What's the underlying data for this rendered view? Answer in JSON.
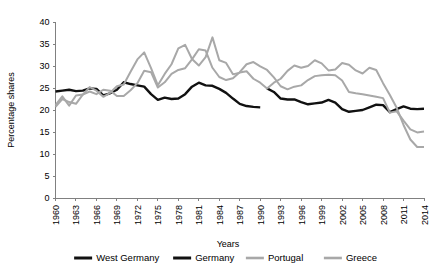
{
  "chart_data": {
    "type": "line",
    "title": "",
    "xlabel": "Years",
    "ylabel": "Percentage shares",
    "xlim": [
      1960,
      2014
    ],
    "ylim": [
      0,
      40
    ],
    "ytick_step": 5,
    "xtick_step": 3,
    "grid": false,
    "legend_position": "bottom",
    "yticks": [
      0,
      5,
      10,
      15,
      20,
      25,
      30,
      35,
      40
    ],
    "xticks": [
      1960,
      1963,
      1966,
      1969,
      1972,
      1975,
      1978,
      1981,
      1984,
      1987,
      1990,
      1993,
      1996,
      1999,
      2002,
      2005,
      2008,
      2011,
      2014
    ],
    "x": [
      1960,
      1961,
      1962,
      1963,
      1964,
      1965,
      1966,
      1967,
      1968,
      1969,
      1970,
      1971,
      1972,
      1973,
      1974,
      1975,
      1976,
      1977,
      1978,
      1979,
      1980,
      1981,
      1982,
      1983,
      1984,
      1985,
      1986,
      1987,
      1988,
      1989,
      1990,
      1991,
      1992,
      1993,
      1994,
      1995,
      1996,
      1997,
      1998,
      1999,
      2000,
      2001,
      2002,
      2003,
      2004,
      2005,
      2006,
      2007,
      2008,
      2009,
      2010,
      2011,
      2012,
      2013,
      2014
    ],
    "series": [
      {
        "name": "West Germany",
        "color": "#111111",
        "width": 2.4,
        "x": [
          1960,
          1961,
          1962,
          1963,
          1964,
          1965,
          1966,
          1967,
          1968,
          1969,
          1970,
          1971,
          1972,
          1973,
          1974,
          1975,
          1976,
          1977,
          1978,
          1979,
          1980,
          1981,
          1982,
          1983,
          1984,
          1985,
          1986,
          1987,
          1988,
          1989,
          1990
        ],
        "values": [
          24.2,
          24.4,
          24.6,
          24.3,
          24.4,
          24.9,
          24.8,
          23.3,
          23.8,
          24.6,
          26.3,
          25.9,
          25.6,
          25.3,
          23.6,
          22.3,
          22.8,
          22.5,
          22.6,
          23.6,
          25.3,
          26.2,
          25.6,
          25.5,
          24.8,
          23.9,
          22.6,
          21.4,
          20.9,
          20.7,
          20.6
        ]
      },
      {
        "name": "Germany",
        "color": "#111111",
        "width": 2.4,
        "x": [
          1991,
          1992,
          1993,
          1994,
          1995,
          1996,
          1997,
          1998,
          1999,
          2000,
          2001,
          2002,
          2003,
          2004,
          2005,
          2006,
          2007,
          2008,
          2009,
          2010,
          2011,
          2012,
          2013,
          2014
        ],
        "values": [
          24.9,
          24.1,
          22.6,
          22.4,
          22.4,
          21.8,
          21.3,
          21.5,
          21.7,
          22.3,
          21.7,
          20.2,
          19.6,
          19.8,
          20.0,
          20.6,
          21.2,
          21.1,
          19.5,
          20.2,
          20.8,
          20.3,
          20.2,
          20.3
        ]
      },
      {
        "name": "Portugal",
        "color": "#a8a8a8",
        "width": 2.0,
        "x": [
          1960,
          1961,
          1962,
          1963,
          1964,
          1965,
          1966,
          1967,
          1968,
          1969,
          1970,
          1971,
          1972,
          1973,
          1974,
          1975,
          1976,
          1977,
          1978,
          1979,
          1980,
          1981,
          1982,
          1983,
          1984,
          1985,
          1986,
          1987,
          1988,
          1989,
          1990,
          1991,
          1992,
          1993,
          1994,
          1995,
          1996,
          1997,
          1998,
          1999,
          2000,
          2001,
          2002,
          2003,
          2004,
          2005,
          2006,
          2007,
          2008,
          2009,
          2010,
          2011,
          2012,
          2013,
          2014
        ],
        "values": [
          21.1,
          23.1,
          21.0,
          23.3,
          23.5,
          24.2,
          23.6,
          24.6,
          24.4,
          23.2,
          23.2,
          24.5,
          26.1,
          28.9,
          28.6,
          25.1,
          26.3,
          28.2,
          29.1,
          29.5,
          31.5,
          33.8,
          33.5,
          29.6,
          27.5,
          26.8,
          27.2,
          28.6,
          30.4,
          30.9,
          29.9,
          29.1,
          27.4,
          25.4,
          24.7,
          25.3,
          25.6,
          26.8,
          27.7,
          27.9,
          28.0,
          27.9,
          26.7,
          24.1,
          23.8,
          23.6,
          23.3,
          23.0,
          22.7,
          19.4,
          19.7,
          17.6,
          15.6,
          14.9,
          15.1
        ]
      },
      {
        "name": "Greece",
        "color": "#a8a8a8",
        "width": 2.0,
        "x": [
          1960,
          1961,
          1962,
          1963,
          1964,
          1965,
          1966,
          1967,
          1968,
          1969,
          1970,
          1971,
          1972,
          1973,
          1974,
          1975,
          1976,
          1977,
          1978,
          1979,
          1980,
          1981,
          1982,
          1983,
          1984,
          1985,
          1986,
          1987,
          1988,
          1989,
          1990,
          1991,
          1992,
          1993,
          1994,
          1995,
          1996,
          1997,
          1998,
          1999,
          2000,
          2001,
          2002,
          2003,
          2004,
          2005,
          2006,
          2007,
          2008,
          2009,
          2010,
          2011,
          2012,
          2013,
          2014
        ],
        "values": [
          20.7,
          22.5,
          21.8,
          21.4,
          23.5,
          25.2,
          24.4,
          23.0,
          23.9,
          25.4,
          25.8,
          28.7,
          31.5,
          33.1,
          29.5,
          25.6,
          28.2,
          30.4,
          34.0,
          34.8,
          31.6,
          30.1,
          32.0,
          36.5,
          31.3,
          30.7,
          28.1,
          28.5,
          28.8,
          27.1,
          26.2,
          24.9,
          26.2,
          27.1,
          28.9,
          30.1,
          29.6,
          30.0,
          31.3,
          30.6,
          29.0,
          29.2,
          30.7,
          30.3,
          29.0,
          28.3,
          29.6,
          29.1,
          26.1,
          23.4,
          20.5,
          16.6,
          13.3,
          11.6,
          11.6
        ]
      }
    ]
  }
}
